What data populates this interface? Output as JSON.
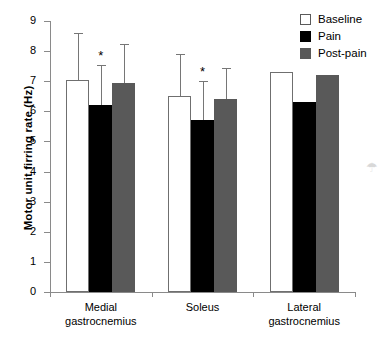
{
  "chart_data": {
    "type": "bar",
    "title": "",
    "xlabel": "",
    "ylabel": "Motor unit firring rate (Hz)",
    "ylim": [
      0,
      9
    ],
    "yticks": [
      0,
      1,
      2,
      3,
      4,
      5,
      6,
      7,
      8,
      9
    ],
    "ytick_labels": [
      "0",
      "1",
      "2",
      "3",
      "4",
      "5",
      "6",
      "7",
      "8",
      "9"
    ],
    "grid": false,
    "legend_position": "top-right",
    "categories": [
      "Medial gastrocnemius",
      "Soleus",
      "Lateral gastrocnemius"
    ],
    "category_lines": [
      [
        "Medial",
        "gastrocnemius"
      ],
      [
        "Soleus",
        ""
      ],
      [
        "Lateral",
        "gastrocnemius"
      ]
    ],
    "series": [
      {
        "name": "Baseline",
        "color": "#ffffff",
        "values": [
          7.05,
          6.5,
          7.3
        ],
        "errors_upper": [
          1.55,
          1.4,
          0.0
        ]
      },
      {
        "name": "Pain",
        "color": "#000000",
        "values": [
          6.2,
          5.7,
          6.3
        ],
        "errors_upper": [
          1.35,
          1.3,
          0.0
        ]
      },
      {
        "name": "Post-pain",
        "color": "#595959",
        "values": [
          6.95,
          6.4,
          7.2
        ],
        "errors_upper": [
          1.3,
          1.05,
          0.0
        ]
      }
    ],
    "annotations": [
      {
        "text": "*",
        "category": "Medial gastrocnemius",
        "series": "Pain"
      },
      {
        "text": "*",
        "category": "Soleus",
        "series": "Pain"
      }
    ]
  },
  "legend": {
    "items": [
      {
        "label": "Baseline",
        "swatch": "baseline"
      },
      {
        "label": "Pain",
        "swatch": "pain"
      },
      {
        "label": "Post-pain",
        "swatch": "postpain"
      }
    ]
  },
  "artifact": {
    "mark": "☂"
  }
}
